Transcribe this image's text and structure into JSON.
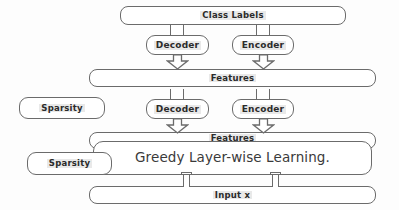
{
  "diagram": {
    "colors": {
      "background": "#fdfdfd",
      "stroke": "#6b6b6b",
      "text": "#2b2b2b",
      "highlight": "#e9e9e9"
    },
    "nodes": {
      "class_labels": "Class Labels",
      "decoder_top": "Decoder",
      "encoder_top": "Encoder",
      "features_top": "Features",
      "sparsity_top": "Sparsity",
      "decoder_bottom": "Decoder",
      "encoder_bottom": "Encoder",
      "features_bottom": "Features",
      "greedy": "Greedy Layer-wise Learning.",
      "sparsity_bottom": "Sparsity",
      "input": "Input x"
    },
    "connectors": [
      {
        "name": "class-labels-to-decoder-top",
        "kind": "stem",
        "direction": "down"
      },
      {
        "name": "class-labels-to-encoder-top",
        "kind": "stem",
        "direction": "down"
      },
      {
        "name": "decoder-top-to-features-top",
        "kind": "block-arrow",
        "direction": "down"
      },
      {
        "name": "encoder-top-to-features-top",
        "kind": "block-arrow",
        "direction": "down"
      },
      {
        "name": "features-top-to-decoder-bottom",
        "kind": "stem",
        "direction": "down"
      },
      {
        "name": "features-top-to-encoder-bottom",
        "kind": "stem",
        "direction": "down"
      },
      {
        "name": "decoder-bottom-to-features-bottom",
        "kind": "block-arrow",
        "direction": "down"
      },
      {
        "name": "encoder-bottom-to-features-bottom",
        "kind": "block-arrow",
        "direction": "down"
      },
      {
        "name": "greedy-to-input-left",
        "kind": "double-line",
        "direction": "down"
      },
      {
        "name": "greedy-to-input-right",
        "kind": "double-line",
        "direction": "down"
      }
    ]
  }
}
